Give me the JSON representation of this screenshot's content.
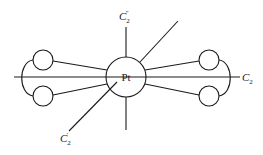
{
  "diagram": {
    "type": "molecular-symmetry-diagram",
    "center_atom": {
      "label": "Pt",
      "cx": 126,
      "cy": 77,
      "r": 20
    },
    "ligand_circles": [
      {
        "id": "left-upper",
        "cx": 43,
        "cy": 60,
        "r": 10
      },
      {
        "id": "left-lower",
        "cx": 43,
        "cy": 96,
        "r": 10
      },
      {
        "id": "right-upper",
        "cx": 209,
        "cy": 60,
        "r": 10
      },
      {
        "id": "right-lower",
        "cx": 209,
        "cy": 96,
        "r": 10
      }
    ],
    "axes": [
      {
        "id": "C2",
        "label_main": "C",
        "label_sub": "2",
        "label_sup": "",
        "orientation": "horizontal"
      },
      {
        "id": "C2-double-prime",
        "label_main": "C",
        "label_sub": "2",
        "label_sup": "″",
        "orientation": "vertical"
      },
      {
        "id": "C2-prime",
        "label_main": "C",
        "label_sub": "2",
        "label_sup": "′",
        "orientation": "diagonal"
      }
    ],
    "colors": {
      "line": "#1a1a1a",
      "background": "#ffffff"
    }
  }
}
